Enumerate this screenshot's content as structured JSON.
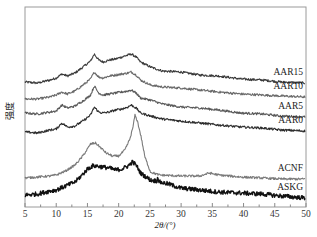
{
  "chart_data": {
    "type": "line",
    "title": "",
    "xlabel": "2θ/(°)",
    "ylabel": "强度",
    "xlim": [
      5,
      50
    ],
    "ylim": [
      0,
      100
    ],
    "x_ticks": [
      5,
      10,
      15,
      20,
      25,
      30,
      35,
      40,
      45,
      50
    ],
    "x_tick_labels": [
      "5",
      "10",
      "15",
      "20",
      "25",
      "30",
      "35",
      "40",
      "45",
      "50"
    ],
    "y_ticks_shown": false,
    "grid": false,
    "legend": "labels placed at right end of each curve",
    "series": [
      {
        "name": "AAR15",
        "color": "#3a3a3a",
        "points": [
          [
            5,
            62.5
          ],
          [
            7,
            62
          ],
          [
            9,
            63.5
          ],
          [
            10,
            64.5
          ],
          [
            10.9,
            66.5
          ],
          [
            11.8,
            65.5
          ],
          [
            13,
            67
          ],
          [
            14.5,
            70.5
          ],
          [
            15.5,
            73
          ],
          [
            16.1,
            76.5
          ],
          [
            16.8,
            73.5
          ],
          [
            17.5,
            72.5
          ],
          [
            18.5,
            73.5
          ],
          [
            19.5,
            74
          ],
          [
            20.5,
            75
          ],
          [
            21.5,
            76
          ],
          [
            22,
            76.5
          ],
          [
            22.8,
            75
          ],
          [
            23.5,
            72.5
          ],
          [
            25.1,
            70
          ],
          [
            27,
            68
          ],
          [
            29.9,
            67.5
          ],
          [
            33,
            66
          ],
          [
            36,
            65.5
          ],
          [
            39.6,
            64
          ],
          [
            43,
            63.5
          ],
          [
            46,
            62.5
          ],
          [
            50,
            62
          ]
        ]
      },
      {
        "name": "AAR10",
        "color": "#6a6a6a",
        "points": [
          [
            5,
            54
          ],
          [
            7,
            54
          ],
          [
            9,
            55
          ],
          [
            10,
            56
          ],
          [
            10.9,
            57.5
          ],
          [
            11.8,
            56.5
          ],
          [
            13,
            58
          ],
          [
            14.5,
            61.5
          ],
          [
            15.5,
            64
          ],
          [
            16.1,
            67.5
          ],
          [
            16.8,
            65
          ],
          [
            17.5,
            64.5
          ],
          [
            18.5,
            65.5
          ],
          [
            19.5,
            66
          ],
          [
            20.5,
            66.5
          ],
          [
            21.5,
            67
          ],
          [
            22,
            67.5
          ],
          [
            22.8,
            66
          ],
          [
            23.5,
            63.5
          ],
          [
            25.1,
            61
          ],
          [
            27,
            60
          ],
          [
            29.9,
            59.5
          ],
          [
            33,
            58.5
          ],
          [
            36,
            57.5
          ],
          [
            39.6,
            56.5
          ],
          [
            43,
            56
          ],
          [
            46,
            55.5
          ],
          [
            50,
            55
          ]
        ]
      },
      {
        "name": "AAR5",
        "color": "#5a5a5a",
        "points": [
          [
            5,
            47
          ],
          [
            7,
            46.5
          ],
          [
            9,
            47.5
          ],
          [
            10,
            48
          ],
          [
            10.9,
            51
          ],
          [
            11.8,
            49.5
          ],
          [
            13,
            50.5
          ],
          [
            14.5,
            53.5
          ],
          [
            15.5,
            56
          ],
          [
            16.1,
            60.5
          ],
          [
            16.8,
            57
          ],
          [
            17.5,
            56
          ],
          [
            18.5,
            56.5
          ],
          [
            19.5,
            57
          ],
          [
            20.5,
            57.5
          ],
          [
            21.5,
            58
          ],
          [
            22,
            58.5
          ],
          [
            22.8,
            57
          ],
          [
            23.5,
            54.5
          ],
          [
            25.1,
            53.5
          ],
          [
            27,
            51.5
          ],
          [
            29.9,
            50
          ],
          [
            33,
            49.5
          ],
          [
            36,
            48.5
          ],
          [
            39.6,
            47
          ],
          [
            43,
            46.5
          ],
          [
            46,
            45.5
          ],
          [
            50,
            45
          ]
        ]
      },
      {
        "name": "AAR0",
        "color": "#2e2e2e",
        "points": [
          [
            5,
            37.5
          ],
          [
            7,
            37
          ],
          [
            9,
            38.5
          ],
          [
            10,
            39
          ],
          [
            10.9,
            42
          ],
          [
            11.8,
            40
          ],
          [
            13,
            40.5
          ],
          [
            14.5,
            43.5
          ],
          [
            15.5,
            46
          ],
          [
            16.1,
            50
          ],
          [
            16.8,
            47.5
          ],
          [
            17.5,
            47
          ],
          [
            18.5,
            47.5
          ],
          [
            19.5,
            48.5
          ],
          [
            20.5,
            49
          ],
          [
            21.5,
            50
          ],
          [
            22,
            51
          ],
          [
            22.8,
            49.5
          ],
          [
            23.5,
            47
          ],
          [
            25.1,
            45.5
          ],
          [
            27,
            44
          ],
          [
            29.9,
            43
          ],
          [
            33,
            42
          ],
          [
            36,
            41
          ],
          [
            39.6,
            40
          ],
          [
            43,
            39.5
          ],
          [
            46,
            38.5
          ],
          [
            50,
            38
          ]
        ]
      },
      {
        "name": "ACNF",
        "color": "#7a7a7a",
        "points": [
          [
            5,
            14.5
          ],
          [
            7,
            15
          ],
          [
            9,
            15.5
          ],
          [
            10,
            16
          ],
          [
            11.5,
            18
          ],
          [
            13,
            21
          ],
          [
            14,
            24.5
          ],
          [
            14.8,
            28
          ],
          [
            15.5,
            31.5
          ],
          [
            16.3,
            32
          ],
          [
            17,
            30
          ],
          [
            18,
            27
          ],
          [
            19,
            25.5
          ],
          [
            20,
            25.5
          ],
          [
            21,
            28.5
          ],
          [
            21.8,
            34
          ],
          [
            22.3,
            40
          ],
          [
            22.6,
            46
          ],
          [
            23,
            43
          ],
          [
            23.6,
            35
          ],
          [
            24.2,
            25
          ],
          [
            25.1,
            17.5
          ],
          [
            26.5,
            16
          ],
          [
            29.9,
            15.5
          ],
          [
            33,
            15.5
          ],
          [
            34.5,
            17
          ],
          [
            36,
            16
          ],
          [
            39.6,
            15
          ],
          [
            43,
            14.5
          ],
          [
            46,
            14
          ],
          [
            50,
            14
          ]
        ]
      },
      {
        "name": "ASKG",
        "color": "#111111",
        "points": [
          [
            5,
            6
          ],
          [
            7,
            6.5
          ],
          [
            9,
            8
          ],
          [
            10,
            8.5
          ],
          [
            11.5,
            10.5
          ],
          [
            13,
            12.5
          ],
          [
            14,
            15.5
          ],
          [
            15,
            19
          ],
          [
            15.8,
            20.5
          ],
          [
            16.5,
            20.5
          ],
          [
            17.5,
            20
          ],
          [
            18.5,
            19.5
          ],
          [
            19.5,
            18.5
          ],
          [
            20.5,
            19
          ],
          [
            21.5,
            20.5
          ],
          [
            22.2,
            22.5
          ],
          [
            22.8,
            21
          ],
          [
            23.5,
            17
          ],
          [
            25.1,
            13.5
          ],
          [
            26.1,
            13
          ],
          [
            26.3,
            15
          ],
          [
            26.5,
            12.5
          ],
          [
            28,
            11.5
          ],
          [
            29.9,
            9.5
          ],
          [
            33,
            8.5
          ],
          [
            36,
            7.5
          ],
          [
            39.6,
            7
          ],
          [
            43,
            6.5
          ],
          [
            46,
            5.5
          ],
          [
            50,
            4.5
          ]
        ]
      }
    ]
  }
}
